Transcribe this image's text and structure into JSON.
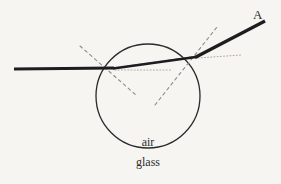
{
  "figure": {
    "background_color": "#f7f5f2",
    "labels": {
      "ray_exit_label": "A",
      "medium_inner_label": "air",
      "medium_outer_label": "glass"
    },
    "colors": {
      "ray_stroke": "#1d1d1f",
      "circle_stroke": "#2a2a2a",
      "normal_dash": "#8d8d8d",
      "guide_dot": "#b0a89e",
      "highlight_cyan": "#7fb7c9",
      "highlight_red": "#8a4040",
      "label_text": "#2b2b2b"
    },
    "geometry": {
      "circle": {
        "cx": 148,
        "cy": 96,
        "r": 52,
        "stroke_width": 1.3
      },
      "incident_ray": {
        "x1": 14,
        "y1": 69,
        "x2": 113,
        "y2": 68,
        "stroke_width": 3.2
      },
      "internal_ray": {
        "x1": 113,
        "y1": 68,
        "x2": 196,
        "y2": 57,
        "stroke_width": 3.0
      },
      "exit_ray": {
        "x1": 196,
        "y1": 57,
        "x2": 265,
        "y2": 21,
        "stroke_width": 3.2
      },
      "normal_left": {
        "x1": 80,
        "y1": 46,
        "x2": 136,
        "y2": 95
      },
      "normal_right": {
        "x1": 155,
        "y1": 105,
        "x2": 217,
        "y2": 27
      },
      "guide_left": {
        "x1": 115,
        "y1": 70,
        "x2": 172,
        "y2": 70
      },
      "guide_right": {
        "x1": 198,
        "y1": 58,
        "x2": 240,
        "y2": 55
      },
      "entry_point": {
        "x": 113,
        "y": 68
      },
      "exit_point": {
        "x": 196,
        "y": 57
      }
    },
    "label_positions": {
      "A": {
        "x": 253,
        "y": 8
      },
      "air": {
        "x": 148,
        "y": 136
      },
      "glass": {
        "x": 148,
        "y": 156
      }
    }
  }
}
